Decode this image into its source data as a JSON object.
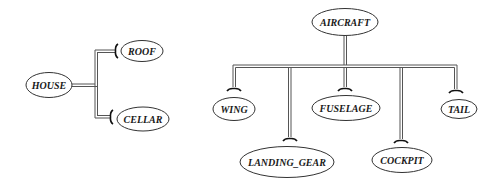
{
  "diagram": {
    "type": "aggregation-hierarchy",
    "trees": [
      {
        "root": {
          "id": "house",
          "label": "HOUSE",
          "cx": 49,
          "cy": 85,
          "rx": 23,
          "ry": 12.5
        },
        "orientation": "horizontal",
        "children": [
          {
            "id": "roof",
            "label": "ROOF",
            "cx": 142,
            "cy": 51,
            "rx": 21,
            "ry": 10.5
          },
          {
            "id": "cellar",
            "label": "CELLAR",
            "cx": 143,
            "cy": 119,
            "rx": 26,
            "ry": 12
          }
        ]
      },
      {
        "root": {
          "id": "aircraft",
          "label": "AIRCRAFT",
          "cx": 345,
          "cy": 22,
          "rx": 33,
          "ry": 13.5
        },
        "orientation": "vertical",
        "children": [
          {
            "id": "wing",
            "label": "WING",
            "cx": 234,
            "cy": 109,
            "rx": 21,
            "ry": 11.5
          },
          {
            "id": "landing_gear",
            "label": "LANDING_GEAR",
            "cx": 287,
            "cy": 162,
            "rx": 47,
            "ry": 15.5
          },
          {
            "id": "fuselage",
            "label": "FUSELAGE",
            "cx": 346,
            "cy": 108,
            "rx": 34,
            "ry": 12.5
          },
          {
            "id": "cockpit",
            "label": "COCKPIT",
            "cx": 402,
            "cy": 160,
            "rx": 30,
            "ry": 12.5
          },
          {
            "id": "tail",
            "label": "TAIL",
            "cx": 459,
            "cy": 109,
            "rx": 18,
            "ry": 9.5
          }
        ]
      }
    ]
  }
}
